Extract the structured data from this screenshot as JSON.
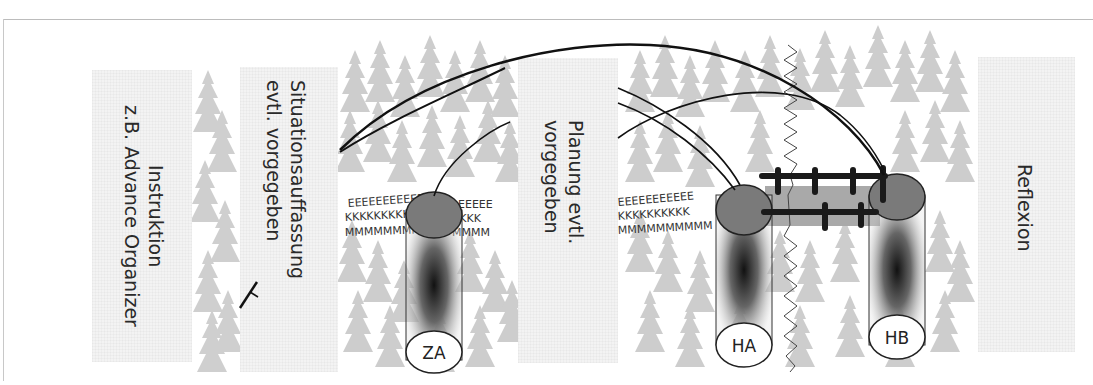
{
  "diagram": {
    "phases": [
      {
        "id": "instruktion",
        "lines": [
          "Instruktion",
          "z.B. Advance Organizer"
        ]
      },
      {
        "id": "situationsauffassung",
        "lines": [
          "Situationsauffassung",
          "evtl. vorgegeben"
        ]
      },
      {
        "id": "planung",
        "lines": [
          "Planung evtl.",
          "vorgegeben"
        ]
      },
      {
        "id": "reflexion",
        "lines": [
          "Reflexion"
        ]
      }
    ],
    "nodes": [
      {
        "id": "ZA",
        "label": "ZA"
      },
      {
        "id": "HA",
        "label": "HA"
      },
      {
        "id": "HB",
        "label": "HB"
      }
    ],
    "letter_bands": {
      "row1": "EEEEEEEEEEE",
      "row2": "KKKKKKKKKK",
      "row3": "MMMMMMMMMM"
    },
    "colors": {
      "tree": "#cfcfcf",
      "node_top": "#7a7a7a",
      "bridge": "#a9a9a9",
      "line": "#111111",
      "textbox": "#f3f3f3"
    }
  }
}
